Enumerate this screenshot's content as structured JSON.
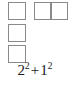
{
  "figure": {
    "name": "unit-square-decomposition",
    "background_color": "#ffffff",
    "line_color": "#8a8a8a",
    "text_color": "#1a1a1a"
  },
  "shapes": {
    "left_column": {
      "label": "column-of-unit-squares",
      "count": 3,
      "cell_width": 1,
      "cell_height": 1,
      "squares": [
        {
          "label": "unit-square-1"
        },
        {
          "label": "unit-square-2"
        },
        {
          "label": "unit-square-3"
        }
      ]
    },
    "right_rectangle": {
      "label": "one-by-two-rectangle",
      "columns": 2,
      "rows": 1,
      "cells": [
        {
          "label": "rect-cell-left"
        },
        {
          "label": "rect-cell-right"
        }
      ]
    }
  },
  "formula": {
    "full_text": "2² + 1²",
    "term1_base": "2",
    "term1_exponent": "2",
    "operator": "+",
    "term2_base": "1",
    "term2_exponent": "2"
  }
}
